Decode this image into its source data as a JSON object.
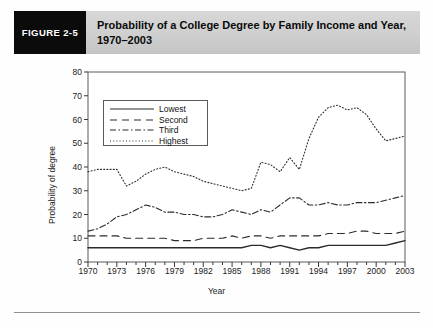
{
  "figure": {
    "badge_label": "FIGURE 2-5",
    "title": "Probability of a College Degree by Family Income and Year, 1970–2003"
  },
  "chart_data": {
    "type": "line",
    "title": "Probability of a College Degree by Family Income and Year, 1970–2003",
    "xlabel": "Year",
    "ylabel": "Probability of degree",
    "xlim": [
      1970,
      2003
    ],
    "ylim": [
      0,
      80
    ],
    "yticks": [
      0,
      10,
      20,
      30,
      40,
      50,
      60,
      70,
      80
    ],
    "xticks": [
      1970,
      1973,
      1976,
      1979,
      1982,
      1985,
      1988,
      1991,
      1994,
      1997,
      2000,
      2003
    ],
    "grid": false,
    "legend_position": "upper-left",
    "x": [
      1970,
      1971,
      1972,
      1973,
      1974,
      1975,
      1976,
      1977,
      1978,
      1979,
      1980,
      1981,
      1982,
      1983,
      1984,
      1985,
      1986,
      1987,
      1988,
      1989,
      1990,
      1991,
      1992,
      1993,
      1994,
      1995,
      1996,
      1997,
      1998,
      1999,
      2000,
      2001,
      2002,
      2003
    ],
    "series": [
      {
        "name": "Lowest",
        "line_style": "solid",
        "values": [
          6,
          6,
          6,
          6,
          6,
          6,
          6,
          6,
          6,
          6,
          6,
          6,
          6,
          6,
          6,
          6,
          6,
          7,
          7,
          6,
          7,
          6,
          5,
          6,
          6,
          7,
          7,
          7,
          7,
          7,
          7,
          7,
          8,
          9
        ]
      },
      {
        "name": "Second",
        "line_style": "dashed",
        "values": [
          11,
          11,
          11,
          11,
          10,
          10,
          10,
          10,
          10,
          9,
          9,
          9,
          10,
          10,
          10,
          11,
          10,
          11,
          11,
          10,
          11,
          11,
          11,
          11,
          11,
          12,
          12,
          12,
          13,
          13,
          12,
          12,
          12,
          13
        ]
      },
      {
        "name": "Third",
        "line_style": "dash-dot",
        "values": [
          13,
          14,
          16,
          19,
          20,
          22,
          24,
          23,
          21,
          21,
          20,
          20,
          19,
          19,
          20,
          22,
          21,
          20,
          22,
          21,
          24,
          27,
          27,
          24,
          24,
          25,
          24,
          24,
          25,
          25,
          25,
          26,
          27,
          28
        ]
      },
      {
        "name": "Highest",
        "line_style": "dotted",
        "values": [
          38,
          39,
          39,
          39,
          32,
          34,
          37,
          39,
          40,
          38,
          37,
          36,
          34,
          33,
          32,
          31,
          30,
          31,
          42,
          41,
          38,
          44,
          39,
          52,
          61,
          65,
          66,
          64,
          65,
          62,
          56,
          51,
          52,
          53
        ]
      }
    ]
  },
  "legend": {
    "items": [
      {
        "label": "Lowest",
        "style": "solid"
      },
      {
        "label": "Second",
        "style": "dashed"
      },
      {
        "label": "Third",
        "style": "dash-dot"
      },
      {
        "label": "Highest",
        "style": "dotted"
      }
    ]
  },
  "colors": {
    "badge_background": "#0b0b0b",
    "badge_text": "#ffffff",
    "title_band": "#cfcfcf",
    "axis": "#3a3a3a",
    "line": "#2b2b2b",
    "page_background": "#ffffff"
  }
}
